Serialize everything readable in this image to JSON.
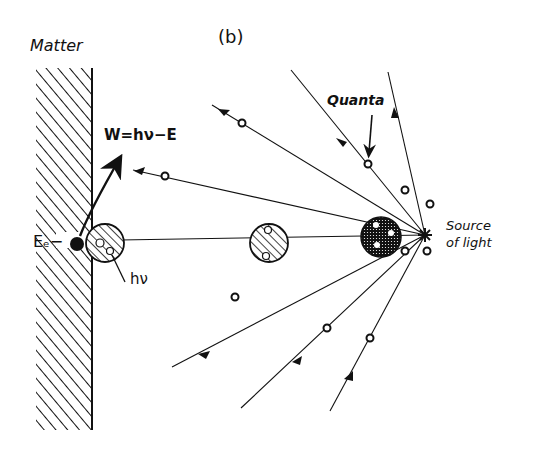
{
  "figure": {
    "panel_label": "(b)",
    "labels": {
      "matter": "Matter",
      "work_equation": "W=hν−E",
      "quanta": "Quanta",
      "source_line1": "Source",
      "source_line2": "of light",
      "electron": "Eₑ−",
      "photon": "hν"
    },
    "elements": {
      "matter_wall": "hatched surface of matter",
      "light_source": "star-shaped point source",
      "rays": 8,
      "quanta_circles": 9,
      "traveling_photons": 3
    },
    "colors": {
      "ink": "#111111",
      "background": "#ffffff"
    }
  }
}
